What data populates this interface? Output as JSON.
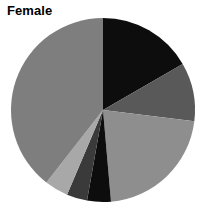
{
  "chart_title": "Female",
  "chart_data": {
    "type": "pie",
    "title": "Female",
    "subtitle": "",
    "xlabel": "",
    "ylabel": "",
    "legend_position": "none",
    "grid": false,
    "start_angle_deg_from_top": 0,
    "direction": "clockwise",
    "center": [
      103,
      110
    ],
    "radius": 92,
    "categories": [
      "Segment 1",
      "Segment 2",
      "Segment 3",
      "Segment 4",
      "Segment 5",
      "Segment 6",
      "Segment 7"
    ],
    "values": [
      16.7,
      10.3,
      21.7,
      4.2,
      3.6,
      4.2,
      39.4
    ],
    "angles_deg": [
      60,
      37,
      78,
      15,
      13,
      15,
      142
    ],
    "colors": [
      "#0d0d0d",
      "#595959",
      "#8e8e8e",
      "#0d0d0d",
      "#3a3a3a",
      "#a8a8a8",
      "#7e7e7e"
    ],
    "slices": [
      {
        "label": "Segment 1",
        "value": 16.7,
        "angle_deg": 60,
        "start_deg": 0,
        "end_deg": 60,
        "color": "#0d0d0d"
      },
      {
        "label": "Segment 2",
        "value": 10.3,
        "angle_deg": 37,
        "start_deg": 60,
        "end_deg": 97,
        "color": "#595959"
      },
      {
        "label": "Segment 3",
        "value": 21.7,
        "angle_deg": 78,
        "start_deg": 97,
        "end_deg": 175,
        "color": "#8e8e8e"
      },
      {
        "label": "Segment 4",
        "value": 4.2,
        "angle_deg": 15,
        "start_deg": 175,
        "end_deg": 190,
        "color": "#0d0d0d"
      },
      {
        "label": "Segment 5",
        "value": 3.6,
        "angle_deg": 13,
        "start_deg": 190,
        "end_deg": 203,
        "color": "#3a3a3a"
      },
      {
        "label": "Segment 6",
        "value": 4.2,
        "angle_deg": 15,
        "start_deg": 203,
        "end_deg": 218,
        "color": "#a8a8a8"
      },
      {
        "label": "Segment 7",
        "value": 39.4,
        "angle_deg": 142,
        "start_deg": 218,
        "end_deg": 360,
        "color": "#7e7e7e"
      }
    ]
  }
}
